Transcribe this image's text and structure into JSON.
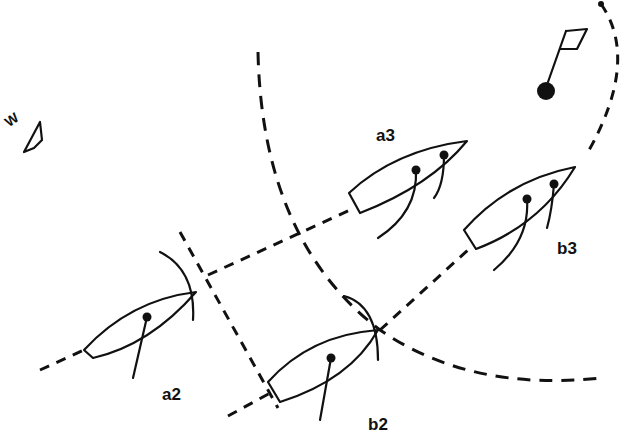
{
  "diagram": {
    "title": "",
    "wind": {
      "label": "W",
      "icon": "wind-arrow-icon"
    },
    "mark": {
      "icon": "flag-mark-icon"
    },
    "boats": [
      {
        "id": "a2",
        "label": "a2",
        "hatched": true
      },
      {
        "id": "a3",
        "label": "a3",
        "hatched": true
      },
      {
        "id": "b2",
        "label": "b2",
        "hatched": false
      },
      {
        "id": "b3",
        "label": "b3",
        "hatched": false
      }
    ],
    "lines": [
      {
        "name": "a-track",
        "style": "dashed"
      },
      {
        "name": "b-track",
        "style": "dashed"
      },
      {
        "name": "overlap-line-left",
        "style": "dashed"
      },
      {
        "name": "two-length-circle",
        "style": "dashed"
      },
      {
        "name": "mark-rounding-path",
        "style": "dashed"
      }
    ]
  }
}
